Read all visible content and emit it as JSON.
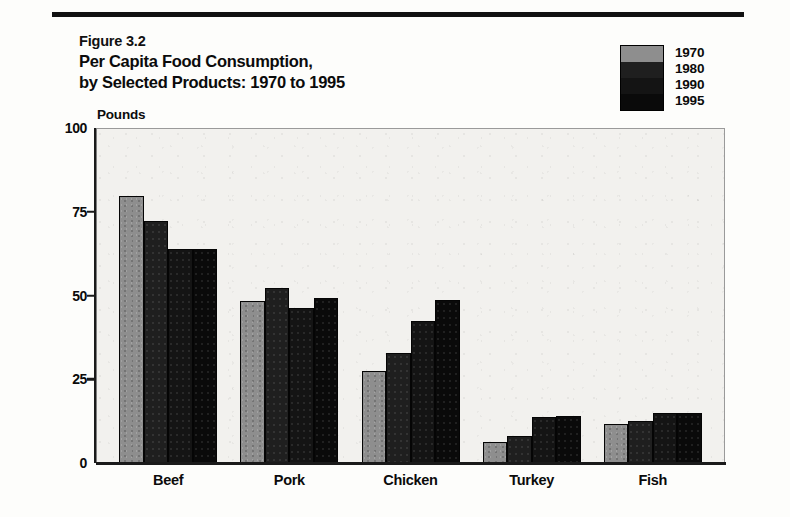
{
  "figure": {
    "number": "Figure 3.2",
    "title_line1": "Per Capita Food Consumption,",
    "title_line2": "by Selected Products:  1970 to 1995"
  },
  "legend": {
    "entries": [
      {
        "label": "1970",
        "color": "#8e8e8e"
      },
      {
        "label": "1980",
        "color": "#1f1f1f"
      },
      {
        "label": "1990",
        "color": "#141414"
      },
      {
        "label": "1995",
        "color": "#0a0a0a"
      }
    ]
  },
  "axis": {
    "unit_label": "Pounds",
    "y_ticks": [
      "100",
      "75",
      "50",
      "25",
      "0"
    ]
  },
  "chart_data": {
    "type": "bar",
    "title": "Per Capita Food Consumption, by Selected Products:  1970 to 1995",
    "subtitle": "Figure 3.2",
    "xlabel": "",
    "ylabel": "Pounds",
    "ylim": [
      0,
      100
    ],
    "yticks": [
      0,
      25,
      50,
      75,
      100
    ],
    "grid": false,
    "legend_position": "top-right",
    "categories": [
      "Beef",
      "Pork",
      "Chicken",
      "Turkey",
      "Fish"
    ],
    "series": [
      {
        "name": "1970",
        "color": "#8e8e8e",
        "values": [
          79.6,
          48.5,
          27.4,
          6.4,
          11.7
        ]
      },
      {
        "name": "1980",
        "color": "#1f1f1f",
        "values": [
          72.1,
          52.1,
          32.7,
          8.1,
          12.4
        ]
      },
      {
        "name": "1990",
        "color": "#141414",
        "values": [
          64.0,
          46.3,
          42.4,
          13.8,
          15.0
        ]
      },
      {
        "name": "1995",
        "color": "#0a0a0a",
        "values": [
          64.0,
          49.4,
          48.8,
          14.1,
          14.9
        ]
      }
    ]
  }
}
